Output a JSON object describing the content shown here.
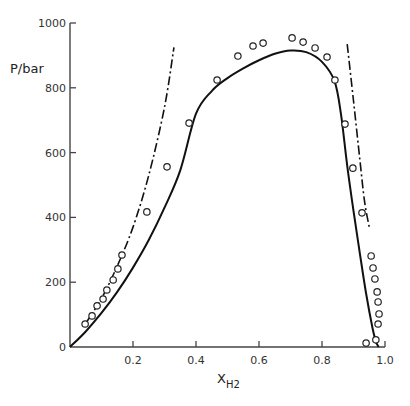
{
  "chart_data": {
    "type": "scatter",
    "title": "",
    "xlabel": "X",
    "xlabel_subscript": "H2",
    "ylabel": "P/bar",
    "xlim": [
      0,
      1.0
    ],
    "ylim": [
      0,
      1000
    ],
    "grid": false,
    "legend": null,
    "x_ticks": [
      0.2,
      0.4,
      0.6,
      0.8,
      1.0
    ],
    "x_tick_labels": [
      "0.2",
      "0.4",
      "0.6",
      "0.8",
      "1.0"
    ],
    "y_ticks": [
      0,
      200,
      400,
      600,
      800,
      1000
    ],
    "y_tick_labels": [
      "0",
      "200",
      "400",
      "600",
      "800",
      "1000"
    ],
    "series": [
      {
        "name": "experimental",
        "style": "open-circles",
        "x": [
          0.048,
          0.07,
          0.086,
          0.105,
          0.117,
          0.137,
          0.152,
          0.165,
          0.244,
          0.308,
          0.378,
          0.467,
          0.533,
          0.581,
          0.613,
          0.705,
          0.74,
          0.778,
          0.816,
          0.841,
          0.873,
          0.898,
          0.927,
          0.956,
          0.962,
          0.968,
          0.975,
          0.978,
          0.981,
          0.978,
          0.971,
          0.94
        ],
        "y": [
          71,
          96,
          127,
          148,
          176,
          207,
          241,
          284,
          417,
          556,
          691,
          824,
          898,
          929,
          938,
          954,
          941,
          923,
          895,
          824,
          688,
          552,
          414,
          281,
          244,
          210,
          170,
          139,
          102,
          71,
          22,
          12
        ]
      },
      {
        "name": "calculated (solid)",
        "style": "solid-line",
        "x": [
          0.0,
          0.05,
          0.1,
          0.15,
          0.2,
          0.25,
          0.3,
          0.35,
          0.4,
          0.45,
          0.5,
          0.55,
          0.6,
          0.65,
          0.7,
          0.75,
          0.8,
          0.84,
          0.86,
          0.88,
          0.9,
          0.92,
          0.94,
          0.96,
          0.97,
          0.975,
          0.98
        ],
        "y": [
          0,
          48,
          105,
          170,
          245,
          330,
          430,
          545,
          720,
          790,
          830,
          860,
          885,
          905,
          915,
          910,
          880,
          820,
          720,
          560,
          420,
          290,
          165,
          60,
          20,
          8,
          0
        ]
      },
      {
        "name": "calculated (dash-dot, left)",
        "style": "dash-dot-line",
        "x": [
          0.048,
          0.1,
          0.15,
          0.2,
          0.25,
          0.3,
          0.33
        ],
        "y": [
          70,
          150,
          250,
          370,
          530,
          740,
          925
        ]
      },
      {
        "name": "calculated (dash-dot, right)",
        "style": "dash-dot-line",
        "x": [
          0.88,
          0.9,
          0.92,
          0.935,
          0.95
        ],
        "y": [
          935,
          760,
          580,
          450,
          370
        ]
      }
    ]
  }
}
